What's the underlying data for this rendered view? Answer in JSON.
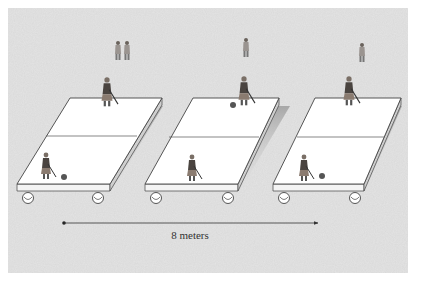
{
  "figure": {
    "colors": {
      "background": "#e4e4e4",
      "platform_top": "#ffffff",
      "platform_edge": "#555555",
      "arrow": "#333333"
    }
  },
  "platforms": [
    {
      "name": "platform-position-1",
      "wheels": 2
    },
    {
      "name": "platform-position-2",
      "wheels": 2
    },
    {
      "name": "platform-position-3",
      "wheels": 2
    }
  ],
  "distance_arrow": {
    "label": "8 meters"
  }
}
